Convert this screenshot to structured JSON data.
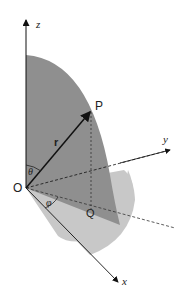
{
  "labels": {
    "z": "z",
    "y": "y",
    "x": "x",
    "origin": "O",
    "point": "P",
    "projection": "Q",
    "radius": "r",
    "theta": "θ",
    "phi": "φ"
  },
  "colors": {
    "dark_sector": "#8f8f8f",
    "light_sector": "#c8c8c8",
    "lines": "#111111"
  }
}
